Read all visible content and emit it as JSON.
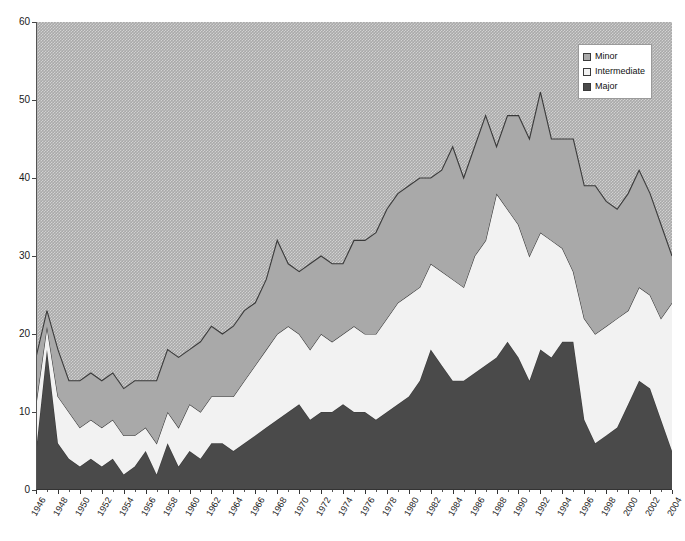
{
  "chart_data": {
    "type": "area",
    "stacked": true,
    "title": "",
    "subtitle": "",
    "xlabel": "",
    "ylabel": "",
    "ylim": [
      0,
      60
    ],
    "xlim": [
      1946,
      2004
    ],
    "y_ticks": [
      0,
      10,
      20,
      30,
      40,
      50,
      60
    ],
    "grid": false,
    "legend_position": "top-right",
    "x": [
      1946,
      1947,
      1948,
      1949,
      1950,
      1951,
      1952,
      1953,
      1954,
      1955,
      1956,
      1957,
      1958,
      1959,
      1960,
      1961,
      1962,
      1963,
      1964,
      1965,
      1966,
      1967,
      1968,
      1969,
      1970,
      1971,
      1972,
      1973,
      1974,
      1975,
      1976,
      1977,
      1978,
      1979,
      1980,
      1981,
      1982,
      1983,
      1984,
      1985,
      1986,
      1987,
      1988,
      1989,
      1990,
      1991,
      1992,
      1993,
      1994,
      1995,
      1996,
      1997,
      1998,
      1999,
      2000,
      2001,
      2002,
      2003,
      2004
    ],
    "tick_labels": [
      "1946",
      "1948",
      "1950",
      "1952",
      "1954",
      "1956",
      "1958",
      "1960",
      "1962",
      "1964",
      "1966",
      "1968",
      "1970",
      "1972",
      "1974",
      "1976",
      "1978",
      "1980",
      "1982",
      "1984",
      "1986",
      "1988",
      "1990",
      "1992",
      "1994",
      "1996",
      "1998",
      "2000",
      "2002",
      "2004"
    ],
    "series": [
      {
        "name": "Major",
        "color": "#4a4a4a",
        "values": [
          5,
          18,
          6,
          4,
          3,
          4,
          3,
          4,
          2,
          3,
          5,
          2,
          6,
          3,
          5,
          4,
          6,
          6,
          5,
          6,
          7,
          8,
          9,
          10,
          11,
          9,
          10,
          10,
          11,
          10,
          10,
          9,
          10,
          11,
          12,
          14,
          18,
          16,
          14,
          14,
          15,
          16,
          17,
          19,
          17,
          14,
          18,
          17,
          19,
          19,
          9,
          6,
          7,
          8,
          11,
          14,
          13,
          9,
          5
        ]
      },
      {
        "name": "Intermediate",
        "color": "#f2f2f2",
        "values": [
          6,
          3,
          6,
          6,
          5,
          5,
          5,
          5,
          5,
          4,
          3,
          4,
          4,
          5,
          6,
          6,
          6,
          6,
          7,
          8,
          9,
          10,
          11,
          11,
          9,
          9,
          10,
          9,
          9,
          11,
          10,
          11,
          12,
          13,
          13,
          12,
          11,
          12,
          13,
          12,
          15,
          16,
          21,
          17,
          17,
          16,
          15,
          15,
          12,
          9,
          13,
          14,
          14,
          14,
          12,
          12,
          12,
          13,
          19
        ]
      },
      {
        "name": "Minor",
        "color": "#a9a9a9",
        "values": [
          6,
          2,
          6,
          4,
          6,
          6,
          6,
          6,
          6,
          7,
          6,
          8,
          8,
          9,
          7,
          9,
          9,
          8,
          9,
          9,
          8,
          9,
          12,
          8,
          8,
          11,
          10,
          10,
          9,
          11,
          12,
          13,
          14,
          14,
          14,
          14,
          11,
          13,
          17,
          14,
          14,
          16,
          6,
          12,
          14,
          15,
          18,
          13,
          14,
          17,
          17,
          19,
          16,
          14,
          15,
          15,
          13,
          12,
          6
        ]
      }
    ]
  },
  "legend": {
    "items": [
      {
        "label": "Minor",
        "swatch": "minor"
      },
      {
        "label": "Intermediate",
        "swatch": "intermediate"
      },
      {
        "label": "Major",
        "swatch": "major"
      }
    ]
  },
  "colors": {
    "minor": "#a9a9a9",
    "intermediate": "#f2f2f2",
    "major": "#4a4a4a",
    "outline": "#3a3a3a",
    "axis": "#333333"
  }
}
